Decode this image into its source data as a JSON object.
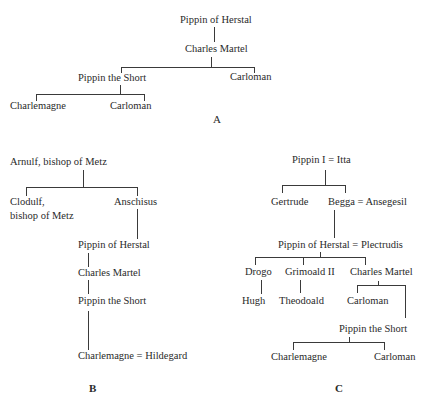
{
  "diagram_a": {
    "caption": "A",
    "nodes": {
      "pippin_herstal": "Pippin of Herstal",
      "charles_martel": "Charles Martel",
      "pippin_short": "Pippin the Short",
      "carloman_1": "Carloman",
      "charlemagne": "Charlemagne",
      "carloman_2": "Carloman"
    }
  },
  "diagram_b": {
    "caption": "B",
    "nodes": {
      "arnulf": "Arnulf, bishop of Metz",
      "clodulf_1": "Clodulf,",
      "clodulf_2": "bishop of Metz",
      "anschisus": "Anschisus",
      "pippin_herstal": "Pippin of Herstal",
      "charles_martel": "Charles Martel",
      "pippin_short": "Pippin the Short",
      "charlemagne": "Charlemagne = Hildegard"
    }
  },
  "diagram_c": {
    "caption": "C",
    "nodes": {
      "pippin_i": "Pippin I = Itta",
      "gertrude": "Gertrude",
      "begga": "Begga = Ansegesil",
      "pippin_herstal": "Pippin of Herstal = Plectrudis",
      "drogo": "Drogo",
      "grimoald": "Grimoald II",
      "charles_martel": "Charles Martel",
      "hugh": "Hugh",
      "theodoald": "Theodoald",
      "carloman_1": "Carloman",
      "pippin_short": "Pippin the Short",
      "charlemagne": "Charlemagne",
      "carloman_2": "Carloman"
    }
  }
}
